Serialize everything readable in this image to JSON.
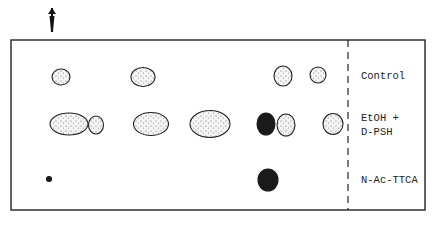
{
  "figure": {
    "type": "thin-layer chromatogram",
    "origin_marker": "arrow-down",
    "lanes": [
      {
        "label_lines": [
          "Control"
        ],
        "spots": [
          {
            "cx": 61,
            "cy": 77,
            "rx": 9,
            "ry": 8,
            "fill": "stippled"
          },
          {
            "cx": 143,
            "cy": 77,
            "rx": 12,
            "ry": 9.5,
            "fill": "stippled"
          },
          {
            "cx": 283,
            "cy": 76,
            "rx": 9,
            "ry": 10,
            "fill": "stippled"
          },
          {
            "cx": 318,
            "cy": 75,
            "rx": 8,
            "ry": 8,
            "fill": "stippled"
          }
        ]
      },
      {
        "label_lines": [
          "EtOH +",
          "D-PSH"
        ],
        "spots": [
          {
            "cx": 69,
            "cy": 124,
            "rx": 19,
            "ry": 11,
            "fill": "stippled"
          },
          {
            "cx": 96,
            "cy": 125,
            "rx": 7.5,
            "ry": 9,
            "fill": "stippled"
          },
          {
            "cx": 151,
            "cy": 124,
            "rx": 17.5,
            "ry": 11.5,
            "fill": "stippled"
          },
          {
            "cx": 210,
            "cy": 124,
            "rx": 20,
            "ry": 13.5,
            "fill": "stippled"
          },
          {
            "cx": 266,
            "cy": 124,
            "rx": 9,
            "ry": 11,
            "fill": "solid"
          },
          {
            "cx": 286,
            "cy": 125,
            "rx": 9,
            "ry": 11,
            "fill": "stippled"
          },
          {
            "cx": 333,
            "cy": 124,
            "rx": 10,
            "ry": 10.5,
            "fill": "stippled"
          }
        ]
      },
      {
        "label_lines": [
          "N-Ac-TTCA"
        ],
        "spots": [
          {
            "cx": 49,
            "cy": 179,
            "rx": 2.5,
            "ry": 2.5,
            "fill": "solid"
          },
          {
            "cx": 268,
            "cy": 180,
            "rx": 10,
            "ry": 11,
            "fill": "solid"
          }
        ]
      }
    ],
    "colors": {
      "ink": "#1a1a1a",
      "background": "#ffffff"
    }
  }
}
